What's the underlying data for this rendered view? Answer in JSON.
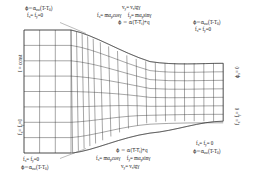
{
  "figure": {
    "type": "mesh-diagram"
  },
  "labels": {
    "top_left_1": "ϕ=α",
    "top_left_1_sub": "aw",
    "top_left_1_rest": "(T-T",
    "top_left_1_sub2": "0",
    "top_left_1_end": ")",
    "top_left_2_a": "f",
    "top_left_2_asub": "x",
    "top_left_2_b": "= f",
    "top_left_2_bsub": "y",
    "top_left_2_c": "=0",
    "top_center_1_a": "v",
    "top_center_1_asub": "y",
    "top_center_1_b": "= v",
    "top_center_1_bsub": "x",
    "top_center_1_c": "tgγ",
    "top_center_2_a": "f",
    "top_center_2_asub": "x",
    "top_center_2_b": "= mα",
    "top_center_2_bsub": "p",
    "top_center_2_c": "cosγ",
    "top_center_2_d": "f",
    "top_center_2_dsub": "y",
    "top_center_2_e": "= mα",
    "top_center_2_esub": "p",
    "top_center_2_f": "sinγ",
    "top_center_3_a": "ϕ = α(T-T",
    "top_center_3_asub": "f",
    "top_center_3_b": ")+q",
    "top_right_1": "ϕ=α",
    "top_right_1_sub": "aw",
    "top_right_1_rest": "(T-T",
    "top_right_1_sub2": "0",
    "top_right_1_end": ")",
    "top_right_2_a": "f",
    "top_right_2_asub": "x",
    "top_right_2_b": "= f",
    "top_right_2_bsub": "y",
    "top_right_2_c": "=0",
    "left_vert_1": "I = const",
    "left_vert_2_a": "f",
    "left_vert_2_asub": "x",
    "left_vert_2_b": "= f",
    "left_vert_2_bsub": "y",
    "left_vert_2_c": "=0",
    "right_vert_1_a": "ϕ",
    "right_vert_1_asub": "x",
    "right_vert_1_b": "= 0",
    "right_vert_2_a": "f",
    "right_vert_2_asub": "x",
    "right_vert_2_b": "= f",
    "right_vert_2_bsub": "y",
    "right_vert_2_c": "= 0",
    "bottom_center_1_a": "ϕ = α(T-T",
    "bottom_center_1_asub": "f",
    "bottom_center_1_b": ")+q",
    "bottom_center_2_a": "f",
    "bottom_center_2_asub": "x",
    "bottom_center_2_b": "= mα",
    "bottom_center_2_bsub": "p",
    "bottom_center_2_c": "cosγ",
    "bottom_center_2_d": "f",
    "bottom_center_2_dsub": "y",
    "bottom_center_2_e": "= mα",
    "bottom_center_2_esub": "p",
    "bottom_center_2_f": "sinγ",
    "bottom_center_3_a": "v",
    "bottom_center_3_asub": "y",
    "bottom_center_3_b": "= v",
    "bottom_center_3_bsub": "x",
    "bottom_center_3_c": "tgγ",
    "bottom_left_1_a": "f",
    "bottom_left_1_asub": "x",
    "bottom_left_1_b": "= f",
    "bottom_left_1_bsub": "y",
    "bottom_left_1_c": "=0",
    "bottom_left_2": "ϕ=α",
    "bottom_left_2_sub": "aw",
    "bottom_left_2_rest": "(T-T",
    "bottom_left_2_sub2": "0",
    "bottom_left_2_end": ")",
    "bottom_right_1_a": "f",
    "bottom_right_1_asub": "x",
    "bottom_right_1_b": "= f",
    "bottom_right_1_bsub": "y",
    "bottom_right_1_c": "= 0",
    "bottom_right_2": "ϕ=α",
    "bottom_right_2_sub": "aw",
    "bottom_right_2_rest": "(T-T",
    "bottom_right_2_sub2": "0",
    "bottom_right_2_end": ")"
  },
  "colors": {
    "mesh_line": "#3a3a3a",
    "boundary": "#2a2a2a",
    "background": "#ffffff",
    "text": "#1a1a1a"
  }
}
